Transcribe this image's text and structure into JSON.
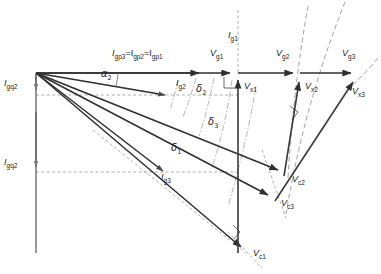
{
  "diagram": {
    "type": "phasor-vector-diagram",
    "width": 381,
    "height": 274,
    "background": "#ffffff",
    "stroke_solid": "#3a3a3a",
    "stroke_dashed": "#8a8a8a",
    "text_color": "#1b1b1b"
  },
  "labels": [
    {
      "id": "Ig1",
      "text": "I",
      "sub": "g1",
      "x": 228,
      "y": 36
    },
    {
      "id": "Igp",
      "text": "I",
      "sub": "gp3",
      "tail": "=I",
      "sub2": "gp2",
      "tail2": "=I",
      "sub3": "gp1",
      "x": 112,
      "y": 54
    },
    {
      "id": "Ig2",
      "text": "I",
      "sub": "g2",
      "x": 176,
      "y": 84
    },
    {
      "id": "Ig3",
      "text": "I",
      "sub": "g3",
      "x": 161,
      "y": 178
    },
    {
      "id": "Igq2a",
      "text": "I",
      "sub": "gq2",
      "x": 4,
      "y": 84
    },
    {
      "id": "Igq2b",
      "text": "I",
      "sub": "gq2",
      "x": 4,
      "y": 163
    },
    {
      "id": "alpha2",
      "text": "α",
      "sub": "2",
      "x": 101,
      "y": 74
    },
    {
      "id": "delta2",
      "text": "δ",
      "sub": "2",
      "x": 196,
      "y": 89
    },
    {
      "id": "delta3",
      "text": "δ",
      "sub": "3",
      "x": 208,
      "y": 122
    },
    {
      "id": "delta1",
      "text": "δ",
      "sub": "1",
      "x": 171,
      "y": 148
    },
    {
      "id": "Vg1",
      "text": "V",
      "sub": "g1",
      "x": 210,
      "y": 54
    },
    {
      "id": "Vg2",
      "text": "V",
      "sub": "g2",
      "x": 276,
      "y": 54
    },
    {
      "id": "Vg3",
      "text": "V",
      "sub": "g3",
      "x": 342,
      "y": 54
    },
    {
      "id": "Vx1",
      "text": "V",
      "sub": "x1",
      "x": 244,
      "y": 87
    },
    {
      "id": "Vx2",
      "text": "V",
      "sub": "x2",
      "x": 305,
      "y": 87
    },
    {
      "id": "Vx3",
      "text": "V",
      "sub": "x3",
      "x": 352,
      "y": 92
    },
    {
      "id": "Vc1",
      "text": "V",
      "sub": "c1",
      "x": 253,
      "y": 254
    },
    {
      "id": "Vc2",
      "text": "V",
      "sub": "c2",
      "x": 292,
      "y": 180
    },
    {
      "id": "Vc3",
      "text": "V",
      "sub": "c3",
      "x": 281,
      "y": 204
    }
  ],
  "geometry": {
    "origin": {
      "x": 36,
      "y": 73
    },
    "vectors_current": [
      {
        "name": "Ig1",
        "x1": 36,
        "y1": 73,
        "x2": 206,
        "y2": 73
      },
      {
        "name": "Ig2",
        "x1": 36,
        "y1": 73,
        "x2": 172,
        "y2": 96
      },
      {
        "name": "Ig3",
        "x1": 36,
        "y1": 73,
        "x2": 170,
        "y2": 172
      }
    ],
    "vectors_voltage_g": [
      {
        "name": "Vg1",
        "x1": 36,
        "y1": 73,
        "x2": 237,
        "y2": 73
      },
      {
        "name": "Vg2",
        "x1": 36,
        "y1": 73,
        "x2": 300,
        "y2": 73
      },
      {
        "name": "Vg3",
        "x1": 36,
        "y1": 73,
        "x2": 358,
        "y2": 73
      }
    ],
    "vectors_voltage_c": [
      {
        "name": "Vc1",
        "x1": 36,
        "y1": 73,
        "x2": 248,
        "y2": 253
      },
      {
        "name": "Vc2",
        "x1": 36,
        "y1": 73,
        "x2": 285,
        "y2": 175
      },
      {
        "name": "Vc3",
        "x1": 36,
        "y1": 73,
        "x2": 276,
        "y2": 200
      }
    ],
    "vectors_voltage_x": [
      {
        "name": "Vx1",
        "x1": 238,
        "y1": 253,
        "x2": 238,
        "y2": 75
      },
      {
        "name": "Vx2",
        "x1": 285,
        "y1": 175,
        "x2": 300,
        "y2": 76
      },
      {
        "name": "Vx3",
        "x1": 276,
        "y1": 200,
        "x2": 358,
        "y2": 76
      }
    ],
    "vectors_igq": [
      {
        "name": "Igq2-a",
        "x1": 36,
        "y1": 73,
        "x2": 36,
        "y2": 95
      },
      {
        "name": "Igq2-b",
        "x1": 36,
        "y1": 110,
        "x2": 36,
        "y2": 172
      }
    ]
  },
  "angles": {
    "alpha2_label": "α2",
    "delta1_label": "δ1",
    "delta2_label": "δ2",
    "delta3_label": "δ3"
  }
}
